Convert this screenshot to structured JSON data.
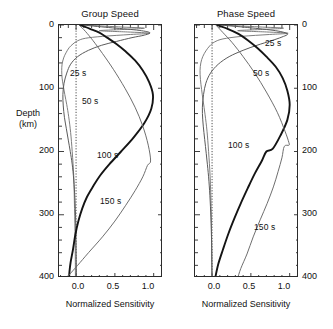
{
  "figure": {
    "xlabel": "Normalized Sensitivity",
    "ylabel_line1": "Depth",
    "ylabel_line2": "(km)"
  },
  "panels": [
    {
      "id": "group-speed",
      "title": "Group Speed",
      "x_ticks": [
        "0.0",
        "0.5",
        "1.0"
      ],
      "y_ticks": [
        "0",
        "100",
        "200",
        "300",
        "400"
      ],
      "curve_labels": [
        "25 s",
        "50 s",
        "100 s",
        "150 s"
      ]
    },
    {
      "id": "phase-speed",
      "title": "Phase Speed",
      "x_ticks": [
        "0.0",
        "0.5",
        "1.0"
      ],
      "y_ticks": [
        "0",
        "100",
        "200",
        "300",
        "400"
      ],
      "curve_labels": [
        "25 s",
        "50 s",
        "100 s",
        "150 s"
      ]
    }
  ],
  "chart_data": {
    "type": "line",
    "xlabel": "Normalized Sensitivity",
    "ylabel": "Depth (km)",
    "xlim": [
      -0.22,
      1.12
    ],
    "ylim": [
      400,
      0
    ],
    "y_inverted": true,
    "grid": false,
    "legend": "inline-curve-labels",
    "x_ticks": [
      0.0,
      0.5,
      1.0
    ],
    "x_minor_tick_spacing": 0.1,
    "y_ticks": [
      0,
      100,
      200,
      300,
      400
    ],
    "y_minor_tick_spacing": 20,
    "zero_reference_line": 0.0,
    "colors": {
      "period_25s": "#6f6f6f",
      "period_50s": "#5a5a5a",
      "period_100s": "#141414",
      "period_150s": "#666666"
    },
    "subplots": [
      {
        "name": "Group Speed",
        "series": [
          {
            "name": "25 s",
            "label_position": {
              "x": 0.02,
              "depth": 72
            },
            "depth": [
              0,
              3,
              5,
              7,
              9,
              11,
              13,
              15,
              18,
              21,
              25,
              30,
              36,
              44,
              52,
              62,
              72,
              84,
              96,
              110,
              126,
              145,
              170,
              200,
              240,
              290,
              340,
              400
            ],
            "sensitivity": [
              0.1,
              0.55,
              0.88,
              0.62,
              0.3,
              0.66,
              0.95,
              0.7,
              0.34,
              0.12,
              0.02,
              -0.04,
              -0.09,
              -0.13,
              -0.16,
              -0.18,
              -0.185,
              -0.18,
              -0.165,
              -0.145,
              -0.12,
              -0.095,
              -0.07,
              -0.05,
              -0.03,
              -0.02,
              -0.012,
              -0.008
            ]
          },
          {
            "name": "50 s",
            "label_position": {
              "x": 0.16,
              "depth": 118
            },
            "depth": [
              0,
              4,
              8,
              12,
              16,
              20,
              26,
              32,
              40,
              50,
              62,
              76,
              92,
              110,
              128,
              146,
              164,
              182,
              200,
              220,
              245,
              275,
              310,
              350,
              400
            ],
            "sensitivity": [
              0.08,
              0.42,
              0.78,
              0.95,
              0.88,
              0.72,
              0.52,
              0.33,
              0.16,
              0.02,
              -0.07,
              -0.12,
              -0.155,
              -0.17,
              -0.165,
              -0.15,
              -0.125,
              -0.1,
              -0.075,
              -0.05,
              -0.03,
              -0.015,
              -0.005,
              0.0,
              0.005
            ]
          },
          {
            "name": "100 s",
            "label_position": {
              "x": 0.33,
              "depth": 205
            },
            "depth": [
              0,
              6,
              12,
              20,
              30,
              42,
              56,
              72,
              90,
              110,
              132,
              155,
              178,
              200,
              220,
              238,
              255,
              272,
              290,
              310,
              332,
              355,
              375,
              390,
              400
            ],
            "sensitivity": [
              0.05,
              0.18,
              0.3,
              0.4,
              0.52,
              0.64,
              0.76,
              0.86,
              0.94,
              0.99,
              0.97,
              0.88,
              0.74,
              0.58,
              0.43,
              0.31,
              0.22,
              0.14,
              0.08,
              0.03,
              -0.01,
              -0.04,
              -0.07,
              -0.085,
              -0.09
            ]
          },
          {
            "name": "150 s",
            "label_position": {
              "x": 0.36,
              "depth": 278
            },
            "depth": [
              0,
              10,
              25,
              45,
              70,
              100,
              130,
              160,
              190,
              215,
              222,
              240,
              262,
              285,
              310,
              335,
              360,
              380,
              395,
              400
            ],
            "sensitivity": [
              0.04,
              0.12,
              0.22,
              0.34,
              0.48,
              0.63,
              0.76,
              0.86,
              0.93,
              0.96,
              0.92,
              0.86,
              0.76,
              0.64,
              0.5,
              0.34,
              0.16,
              0.02,
              -0.09,
              -0.13
            ]
          }
        ]
      },
      {
        "name": "Phase Speed",
        "series": [
          {
            "name": "25 s",
            "label_position": {
              "x": 0.78,
              "depth": 24
            },
            "depth": [
              0,
              3,
              5,
              7,
              9,
              11,
              13,
              15,
              18,
              22,
              27,
              33,
              41,
              50,
              60,
              72,
              86,
              102,
              120,
              142,
              168,
              200,
              240,
              290,
              340,
              400
            ],
            "sensitivity": [
              0.12,
              0.6,
              0.92,
              0.65,
              0.33,
              0.7,
              0.98,
              0.74,
              0.38,
              0.14,
              0.03,
              -0.03,
              -0.08,
              -0.12,
              -0.145,
              -0.155,
              -0.15,
              -0.135,
              -0.115,
              -0.09,
              -0.065,
              -0.045,
              -0.025,
              -0.012,
              -0.006,
              -0.003
            ]
          },
          {
            "name": "50 s",
            "label_position": {
              "x": 0.68,
              "depth": 72
            },
            "depth": [
              0,
              4,
              9,
              14,
              19,
              25,
              32,
              40,
              50,
              62,
              76,
              92,
              110,
              130,
              150,
              170,
              192,
              215,
              240,
              270,
              305,
              345,
              400
            ],
            "sensitivity": [
              0.1,
              0.46,
              0.82,
              0.97,
              0.9,
              0.76,
              0.58,
              0.4,
              0.22,
              0.08,
              -0.02,
              -0.08,
              -0.11,
              -0.125,
              -0.12,
              -0.105,
              -0.085,
              -0.065,
              -0.045,
              -0.028,
              -0.015,
              -0.006,
              0.0
            ]
          },
          {
            "name": "100 s",
            "label_position": {
              "x": 0.38,
              "depth": 170
            },
            "depth": [
              0,
              6,
              14,
              24,
              36,
              50,
              66,
              84,
              104,
              126,
              150,
              175,
              196,
              200,
              215,
              235,
              258,
              282,
              305,
              330,
              355,
              378,
              400
            ],
            "sensitivity": [
              0.06,
              0.2,
              0.34,
              0.46,
              0.58,
              0.7,
              0.82,
              0.91,
              0.97,
              1.0,
              0.97,
              0.88,
              0.78,
              0.7,
              0.64,
              0.55,
              0.46,
              0.37,
              0.29,
              0.21,
              0.14,
              0.08,
              0.04
            ]
          },
          {
            "name": "150 s",
            "label_position": {
              "x": 0.62,
              "depth": 300
            },
            "depth": [
              0,
              12,
              28,
              50,
              76,
              106,
              138,
              168,
              186,
              190,
              192,
              210,
              232,
              256,
              282,
              308,
              335,
              362,
              385,
              400
            ],
            "sensitivity": [
              0.05,
              0.14,
              0.26,
              0.4,
              0.55,
              0.7,
              0.84,
              0.94,
              0.99,
              0.99,
              0.93,
              0.9,
              0.85,
              0.79,
              0.71,
              0.62,
              0.53,
              0.45,
              0.37,
              0.33
            ]
          }
        ]
      }
    ]
  }
}
